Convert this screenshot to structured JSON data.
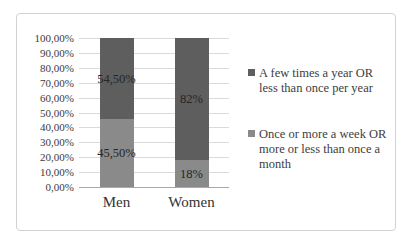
{
  "chart_data": {
    "type": "bar",
    "stacked": true,
    "orientation": "vertical",
    "categories": [
      "Men",
      "Women"
    ],
    "series": [
      {
        "name": "Once or more a week OR more or less than once a month",
        "values": [
          45.5,
          18
        ],
        "data_labels": [
          "45,50%",
          "18%"
        ],
        "color": "#8a8a8a"
      },
      {
        "name": "A few times a year OR less than once per year",
        "values": [
          54.5,
          82
        ],
        "data_labels": [
          "54,50%",
          "82%"
        ],
        "color": "#5e5e5e"
      }
    ],
    "title": "",
    "xlabel": "",
    "ylabel": "",
    "ylim": [
      0,
      100
    ],
    "ytick_step": 10,
    "yticks": [
      "100,00%",
      "90,00%",
      "80,00%",
      "70,00%",
      "60,00%",
      "50,00%",
      "40,00%",
      "30,00%",
      "20,00%",
      "10,00%",
      "0,00%"
    ],
    "grid": true,
    "legend_position": "right",
    "legend": [
      {
        "label": "A few times a year OR less than once per year",
        "color": "#5e5e5e"
      },
      {
        "label": "Once or more a week OR more or less than once a month",
        "color": "#8a8a8a"
      }
    ],
    "colors": {
      "gridline": "#dadada",
      "axis_line": "#a8a8a8",
      "frame_border": "#d2d2d2",
      "background": "#ffffff"
    }
  }
}
